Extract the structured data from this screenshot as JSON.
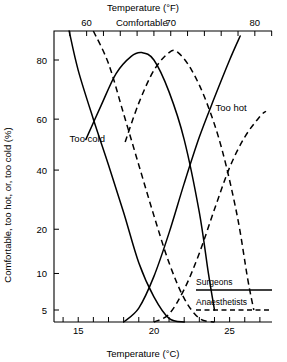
{
  "chart_data": {
    "type": "line",
    "title": "",
    "xlabel": "Temperature (°C)",
    "xlabel_top": "Temperature (°F)",
    "ylabel": "Comfortable, too hot, or, too cold (%)",
    "xlim_c": [
      13.4,
      27.8
    ],
    "ylim": [
      3,
      90
    ],
    "yscale": "probit",
    "grid": false,
    "bottom_axis": {
      "unit": "°C",
      "tick_values": [
        14,
        15,
        16,
        17,
        18,
        19,
        20,
        21,
        22,
        23,
        24,
        25,
        26,
        27
      ],
      "labeled_ticks": [
        15,
        20,
        25
      ],
      "tick_labels": [
        "15",
        "20",
        "25"
      ]
    },
    "top_axis": {
      "unit": "°F",
      "tick_values_f": [
        58,
        60,
        62,
        64,
        66,
        68,
        70,
        72,
        74,
        76,
        78,
        80,
        82
      ],
      "labeled_ticks": [
        60,
        70,
        80
      ],
      "tick_labels": [
        "60",
        "70",
        "80"
      ]
    },
    "y_axis": {
      "tick_values": [
        5,
        10,
        20,
        40,
        60,
        80
      ],
      "tick_labels": [
        "5",
        "10",
        "20",
        "40",
        "60",
        "80"
      ]
    },
    "annotations": [
      {
        "text": "Comfortable",
        "x_c": 19.2,
        "y_pct": 88
      },
      {
        "text": "Too cold",
        "x_c": 15.6,
        "y_pct": 51
      },
      {
        "text": "Too hot",
        "x_c": 25.1,
        "y_pct": 63
      }
    ],
    "legend": {
      "position": "bottom-right",
      "entries": [
        {
          "name": "Surgeons",
          "style": "solid"
        },
        {
          "name": "Anaesthetists",
          "style": "dashed"
        }
      ]
    },
    "series": [
      {
        "name": "Too cold — Surgeons",
        "group": "Surgeons",
        "style": "solid",
        "points": [
          {
            "x_c": 14.4,
            "y_pct": 88
          },
          {
            "x_c": 15.0,
            "y_pct": 77
          },
          {
            "x_c": 16.0,
            "y_pct": 60
          },
          {
            "x_c": 17.0,
            "y_pct": 42
          },
          {
            "x_c": 18.0,
            "y_pct": 25
          },
          {
            "x_c": 19.0,
            "y_pct": 12
          },
          {
            "x_c": 20.0,
            "y_pct": 6.5
          },
          {
            "x_c": 21.0,
            "y_pct": 4.2
          },
          {
            "x_c": 22.0,
            "y_pct": 3.4
          }
        ]
      },
      {
        "name": "Too cold — Anaesthetists",
        "group": "Anaesthetists",
        "style": "dashed",
        "points": [
          {
            "x_c": 16.0,
            "y_pct": 88
          },
          {
            "x_c": 17.0,
            "y_pct": 79
          },
          {
            "x_c": 18.0,
            "y_pct": 62
          },
          {
            "x_c": 19.0,
            "y_pct": 42
          },
          {
            "x_c": 20.0,
            "y_pct": 24
          },
          {
            "x_c": 21.0,
            "y_pct": 12
          },
          {
            "x_c": 22.0,
            "y_pct": 6.3
          },
          {
            "x_c": 23.0,
            "y_pct": 4.2
          },
          {
            "x_c": 24.0,
            "y_pct": 3.4
          }
        ]
      },
      {
        "name": "Comfortable — Surgeons",
        "group": "Surgeons",
        "style": "solid",
        "points": [
          {
            "x_c": 15.5,
            "y_pct": 52
          },
          {
            "x_c": 16.5,
            "y_pct": 65
          },
          {
            "x_c": 17.5,
            "y_pct": 76
          },
          {
            "x_c": 18.5,
            "y_pct": 81
          },
          {
            "x_c": 19.2,
            "y_pct": 82
          },
          {
            "x_c": 20.0,
            "y_pct": 80
          },
          {
            "x_c": 21.0,
            "y_pct": 70
          },
          {
            "x_c": 22.0,
            "y_pct": 52
          },
          {
            "x_c": 23.0,
            "y_pct": 25
          },
          {
            "x_c": 23.6,
            "y_pct": 10
          },
          {
            "x_c": 24.0,
            "y_pct": 5
          }
        ]
      },
      {
        "name": "Comfortable — Anaesthetists",
        "group": "Anaesthetists",
        "style": "dashed",
        "points": [
          {
            "x_c": 18.1,
            "y_pct": 51
          },
          {
            "x_c": 19.0,
            "y_pct": 66
          },
          {
            "x_c": 20.0,
            "y_pct": 77
          },
          {
            "x_c": 21.0,
            "y_pct": 82
          },
          {
            "x_c": 21.6,
            "y_pct": 82
          },
          {
            "x_c": 22.5,
            "y_pct": 77
          },
          {
            "x_c": 23.5,
            "y_pct": 66
          },
          {
            "x_c": 24.5,
            "y_pct": 48
          },
          {
            "x_c": 25.5,
            "y_pct": 24
          },
          {
            "x_c": 26.2,
            "y_pct": 9
          },
          {
            "x_c": 26.6,
            "y_pct": 5
          }
        ]
      },
      {
        "name": "Too hot — Surgeons",
        "group": "Surgeons",
        "style": "solid",
        "points": [
          {
            "x_c": 18.0,
            "y_pct": 3.4
          },
          {
            "x_c": 19.0,
            "y_pct": 5.2
          },
          {
            "x_c": 20.0,
            "y_pct": 9.5
          },
          {
            "x_c": 21.0,
            "y_pct": 19
          },
          {
            "x_c": 22.0,
            "y_pct": 35
          },
          {
            "x_c": 23.0,
            "y_pct": 53
          },
          {
            "x_c": 24.0,
            "y_pct": 68
          },
          {
            "x_c": 25.0,
            "y_pct": 80
          },
          {
            "x_c": 25.7,
            "y_pct": 86
          }
        ]
      },
      {
        "name": "Too hot — Anaesthetists",
        "group": "Anaesthetists",
        "style": "dashed",
        "points": [
          {
            "x_c": 20.0,
            "y_pct": 3.4
          },
          {
            "x_c": 21.0,
            "y_pct": 4.6
          },
          {
            "x_c": 22.0,
            "y_pct": 7.5
          },
          {
            "x_c": 23.0,
            "y_pct": 14
          },
          {
            "x_c": 24.0,
            "y_pct": 26
          },
          {
            "x_c": 25.0,
            "y_pct": 41
          },
          {
            "x_c": 26.0,
            "y_pct": 53
          },
          {
            "x_c": 27.0,
            "y_pct": 61
          },
          {
            "x_c": 27.4,
            "y_pct": 63
          }
        ]
      }
    ]
  }
}
